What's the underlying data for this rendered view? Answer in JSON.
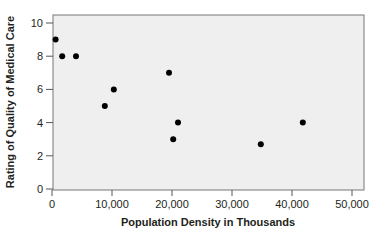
{
  "chart_data": {
    "type": "scatter",
    "title": "",
    "xlabel": "Population Density in Thousands",
    "ylabel": "Rating of Quality of Medical Care",
    "xlim": [
      0,
      50000
    ],
    "ylim": [
      0,
      10
    ],
    "x_ticks": [
      0,
      10000,
      20000,
      30000,
      40000,
      50000
    ],
    "x_tick_labels": [
      "0",
      "10,000",
      "20,000",
      "30,000",
      "40,000",
      "50,000"
    ],
    "y_ticks": [
      0,
      2,
      4,
      6,
      8,
      10
    ],
    "y_tick_labels": [
      "0",
      "2",
      "4",
      "6",
      "8",
      "10"
    ],
    "grid": false,
    "legend": null,
    "series": [
      {
        "name": "cities",
        "x": [
          600,
          1700,
          4000,
          8800,
          10300,
          19500,
          20200,
          21000,
          34800,
          41800
        ],
        "y": [
          9,
          8,
          8,
          5,
          6,
          7,
          3,
          4,
          2.7,
          4
        ]
      }
    ]
  },
  "colors": {
    "plot_background": "#efefef",
    "point": "#000000",
    "axis": "#555555",
    "text": "#231f20"
  }
}
